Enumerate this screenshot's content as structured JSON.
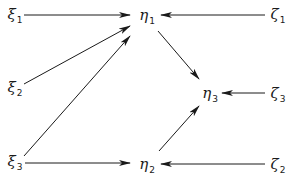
{
  "diagram": {
    "type": "path-diagram",
    "line_color": "#1a1a1a",
    "nodes": [
      {
        "id": "xi1",
        "symbol": "ξ",
        "subscript": "1",
        "x": 15,
        "y": 16
      },
      {
        "id": "xi2",
        "symbol": "ξ",
        "subscript": "2",
        "x": 15,
        "y": 89
      },
      {
        "id": "xi3",
        "symbol": "ξ",
        "subscript": "3",
        "x": 15,
        "y": 163
      },
      {
        "id": "eta1",
        "symbol": "η",
        "subscript": "1",
        "x": 147,
        "y": 17
      },
      {
        "id": "eta2",
        "symbol": "η",
        "subscript": "2",
        "x": 147,
        "y": 166
      },
      {
        "id": "eta3",
        "symbol": "η",
        "subscript": "3",
        "x": 210,
        "y": 95
      },
      {
        "id": "zeta1",
        "symbol": "ζ",
        "subscript": "1",
        "x": 278,
        "y": 16
      },
      {
        "id": "zeta3",
        "symbol": "ζ",
        "subscript": "3",
        "x": 278,
        "y": 95
      },
      {
        "id": "zeta2",
        "symbol": "ζ",
        "subscript": "2",
        "x": 278,
        "y": 166
      }
    ],
    "edges": [
      {
        "from": "xi1",
        "to": "eta1",
        "x1": 24,
        "y1": 15,
        "x2": 130,
        "y2": 15
      },
      {
        "from": "xi2",
        "to": "eta1",
        "x1": 24,
        "y1": 84,
        "x2": 130,
        "y2": 26
      },
      {
        "from": "xi3",
        "to": "eta1",
        "x1": 24,
        "y1": 156,
        "x2": 130,
        "y2": 36
      },
      {
        "from": "xi3",
        "to": "eta2",
        "x1": 25,
        "y1": 163,
        "x2": 130,
        "y2": 163
      },
      {
        "from": "zeta1",
        "to": "eta1",
        "x1": 265,
        "y1": 15,
        "x2": 161,
        "y2": 15
      },
      {
        "from": "eta1",
        "to": "eta3",
        "x1": 158,
        "y1": 31,
        "x2": 199,
        "y2": 79
      },
      {
        "from": "zeta3",
        "to": "eta3",
        "x1": 265,
        "y1": 93,
        "x2": 222,
        "y2": 93
      },
      {
        "from": "eta2",
        "to": "eta3",
        "x1": 159,
        "y1": 151,
        "x2": 199,
        "y2": 106
      },
      {
        "from": "zeta2",
        "to": "eta2",
        "x1": 265,
        "y1": 164,
        "x2": 161,
        "y2": 164
      }
    ]
  }
}
